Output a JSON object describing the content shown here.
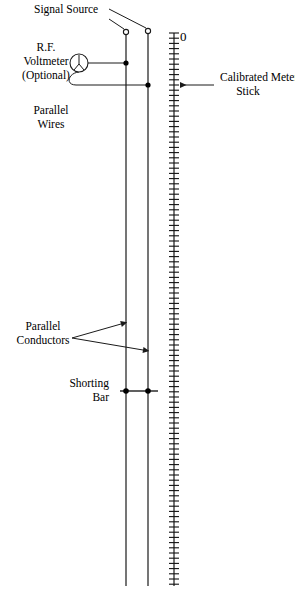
{
  "diagram": {
    "background_color": "#ffffff",
    "line_color": "#1a1a1a",
    "labels": {
      "signal_source": "Signal Source",
      "rf_voltmeter_line1": "R.F.",
      "rf_voltmeter_line2": "Voltmeter",
      "rf_voltmeter_line3": "(Optional)",
      "parallel_wires_line1": "Parallel",
      "parallel_wires_line2": "Wires",
      "parallel_conductors_line1": "Parallel",
      "parallel_conductors_line2": "Conductors",
      "shorting_bar_line1": "Shorting",
      "shorting_bar_line2": "Bar",
      "calibrated_meter_stick_line1": "Calibrated Meter",
      "calibrated_meter_stick_line2": "Stick",
      "scale_zero": "0"
    },
    "geometry": {
      "left_wire_x": 126,
      "right_wire_x": 148,
      "wire_top_y": 33,
      "wire_bottom_y": 586,
      "meter_stick_x": 174,
      "meter_stick_top_y": 33,
      "meter_stick_bottom_y": 586,
      "tick_spacing_px": 5.2,
      "tick_half_width_px": 5,
      "shorting_bar_y": 391,
      "shorting_bar_x1": 120,
      "shorting_bar_x2": 158,
      "voltmeter_center_x": 79,
      "voltmeter_center_y": 63,
      "voltmeter_radius": 9,
      "voltmeter_top_lead_y": 63,
      "voltmeter_bottom_lead_y": 85,
      "terminal_left_x": 126,
      "terminal_left_y": 32,
      "terminal_right_x": 148,
      "terminal_right_y": 31,
      "terminal_radius": 2.6,
      "meter_arrow_y": 85,
      "meter_arrow_from_x": 214,
      "meter_arrow_to_x": 179
    }
  }
}
